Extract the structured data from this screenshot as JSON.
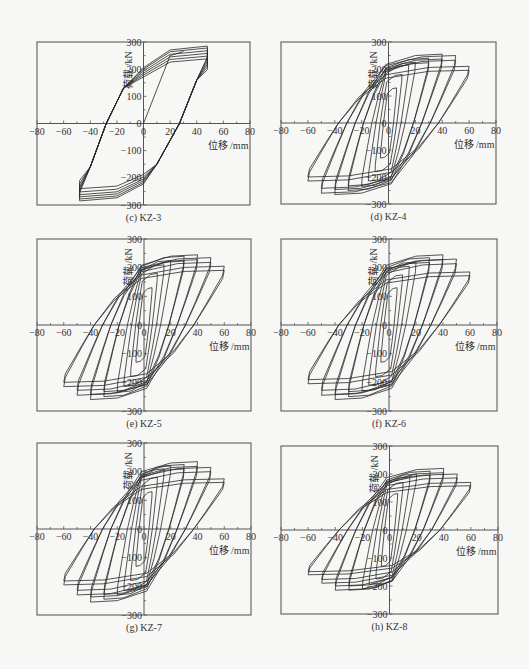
{
  "figure": {
    "panels": [
      {
        "id": "c",
        "caption": "(c)  KZ-3",
        "frame": [
          37,
          42,
          250,
          205
        ]
      },
      {
        "id": "d",
        "caption": "(d)  KZ-4",
        "frame": [
          281,
          42,
          496,
          204
        ]
      },
      {
        "id": "e",
        "caption": "(e)  KZ-5",
        "frame": [
          37,
          239,
          251,
          411
        ]
      },
      {
        "id": "f",
        "caption": "(f)  KZ-6",
        "frame": [
          281,
          239,
          497,
          411
        ]
      },
      {
        "id": "g",
        "caption": "(g)  KZ-7",
        "frame": [
          37,
          443,
          251,
          615
        ]
      },
      {
        "id": "h",
        "caption": "(h)  KZ-8",
        "frame": [
          281,
          446,
          498,
          614
        ]
      }
    ]
  },
  "chart_data": [
    {
      "type": "line",
      "title": "(c) KZ-3",
      "xlabel": "位移 /mm",
      "ylabel": "荷载 /kN",
      "xlim": [
        -80,
        80
      ],
      "ylim": [
        -300,
        300
      ],
      "xticks": [
        -80,
        -60,
        -40,
        -20,
        0,
        20,
        40,
        60,
        80
      ],
      "yticks": [
        -300,
        -200,
        -100,
        0,
        100,
        200,
        300
      ],
      "grid": false,
      "series": [
        {
          "name": "initial loading",
          "x": [
            0,
            20,
            30
          ],
          "y": [
            0,
            250,
            265
          ]
        },
        {
          "name": "hysteresis loops",
          "amplitudes_mm": [
            48,
            48,
            48,
            48,
            48,
            48
          ],
          "peak_load_pos_kN": [
            285,
            278,
            268,
            258,
            248,
            238
          ],
          "peak_load_neg_kN": [
            -285,
            -278,
            -270,
            -262,
            -252,
            -240
          ],
          "zero_crossing_mm": [
            27,
            -28
          ]
        }
      ]
    },
    {
      "type": "line",
      "title": "(d) KZ-4",
      "xlabel": "位移 /mm",
      "ylabel": "荷载 /kN",
      "xlim": [
        -80,
        80
      ],
      "ylim": [
        -300,
        300
      ],
      "xticks": [
        -80,
        -60,
        -40,
        -20,
        0,
        20,
        40,
        60,
        80
      ],
      "yticks": [
        -300,
        -200,
        -100,
        0,
        100,
        200,
        300
      ],
      "grid": false,
      "series": [
        {
          "name": "hysteresis loops",
          "amplitudes_mm": [
            6,
            10,
            15,
            20,
            30,
            40,
            50,
            60
          ],
          "peak_load_pos_kN": [
            130,
            180,
            215,
            225,
            240,
            255,
            250,
            210
          ],
          "peak_load_neg_kN": [
            -130,
            -180,
            -215,
            -235,
            -250,
            -265,
            -260,
            -215
          ]
        }
      ]
    },
    {
      "type": "line",
      "title": "(e) KZ-5",
      "xlabel": "位移 /mm",
      "ylabel": "荷载 /kN",
      "xlim": [
        -80,
        80
      ],
      "ylim": [
        -300,
        300
      ],
      "xticks": [
        -80,
        -60,
        -40,
        -20,
        0,
        20,
        40,
        60,
        80
      ],
      "yticks": [
        -300,
        -200,
        -100,
        0,
        100,
        200,
        300
      ],
      "grid": false,
      "series": [
        {
          "name": "hysteresis loops",
          "amplitudes_mm": [
            6,
            10,
            15,
            20,
            30,
            40,
            50,
            60
          ],
          "peak_load_pos_kN": [
            130,
            180,
            210,
            225,
            240,
            245,
            235,
            205
          ],
          "peak_load_neg_kN": [
            -130,
            -180,
            -215,
            -235,
            -250,
            -260,
            -245,
            -215
          ]
        }
      ]
    },
    {
      "type": "line",
      "title": "(f) KZ-6",
      "xlabel": "位移 /mm",
      "ylabel": "荷载 /kN",
      "xlim": [
        -80,
        80
      ],
      "ylim": [
        -300,
        300
      ],
      "xticks": [
        -80,
        -60,
        -40,
        -20,
        0,
        20,
        40,
        60,
        80
      ],
      "yticks": [
        -300,
        -200,
        -100,
        0,
        100,
        200,
        300
      ],
      "grid": false,
      "series": [
        {
          "name": "hysteresis loops",
          "amplitudes_mm": [
            6,
            10,
            15,
            20,
            30,
            40,
            50,
            60
          ],
          "peak_load_pos_kN": [
            130,
            175,
            205,
            220,
            235,
            245,
            230,
            185
          ],
          "peak_load_neg_kN": [
            -130,
            -180,
            -210,
            -230,
            -250,
            -260,
            -245,
            -205
          ]
        }
      ]
    },
    {
      "type": "line",
      "title": "(g) KZ-7",
      "xlabel": "位移 /mm",
      "ylabel": "荷载 /kN",
      "xlim": [
        -80,
        80
      ],
      "ylim": [
        -300,
        300
      ],
      "xticks": [
        -80,
        -60,
        -40,
        -20,
        0,
        20,
        40,
        60,
        80
      ],
      "yticks": [
        -300,
        -200,
        -100,
        0,
        100,
        200,
        300
      ],
      "grid": false,
      "series": [
        {
          "name": "hysteresis loops",
          "amplitudes_mm": [
            6,
            10,
            15,
            20,
            30,
            40,
            50,
            60
          ],
          "peak_load_pos_kN": [
            130,
            180,
            210,
            220,
            225,
            235,
            215,
            175
          ],
          "peak_load_neg_kN": [
            -130,
            -180,
            -215,
            -230,
            -245,
            -255,
            -230,
            -195
          ]
        }
      ]
    },
    {
      "type": "line",
      "title": "(h) KZ-8",
      "xlabel": "位移 /mm",
      "ylabel": "荷载 /kN",
      "xlim": [
        -80,
        80
      ],
      "ylim": [
        -300,
        300
      ],
      "xticks": [
        -80,
        -60,
        -40,
        -20,
        0,
        20,
        40,
        60,
        80
      ],
      "yticks": [
        -300,
        -200,
        -100,
        0,
        100,
        200,
        300
      ],
      "grid": false,
      "series": [
        {
          "name": "hysteresis loops",
          "amplitudes_mm": [
            6,
            10,
            15,
            20,
            30,
            40,
            50,
            60
          ],
          "peak_load_pos_kN": [
            130,
            170,
            190,
            200,
            210,
            220,
            200,
            170
          ],
          "peak_load_neg_kN": [
            -130,
            -175,
            -195,
            -210,
            -215,
            -215,
            -190,
            -160
          ]
        }
      ]
    }
  ],
  "labels": {
    "xlabel": "位移 /mm",
    "ylabel": "荷载 /kN"
  }
}
